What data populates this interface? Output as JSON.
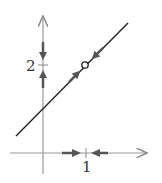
{
  "diagram": {
    "type": "phase-line-diagram",
    "axes": {
      "x_tick_label": "1",
      "y_tick_label": "2"
    },
    "line": {
      "description": "line through (0, 1) with slope 1",
      "marked_point": "open circle at (1, 2)"
    },
    "arrows": {
      "y_axis": [
        "down toward 2 from above",
        "up toward 2 from below"
      ],
      "x_axis": [
        "right toward 1 from left",
        "left toward 1 from right"
      ],
      "line": [
        "up-right toward point from below",
        "down-left toward point from above"
      ]
    },
    "colors": {
      "axis": "#888888",
      "line": "#222222",
      "arrow": "#555555"
    }
  }
}
